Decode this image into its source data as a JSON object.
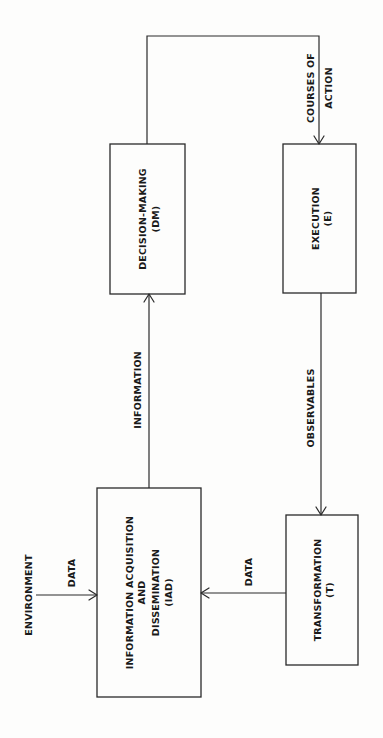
{
  "diagram": {
    "orientation": "rotated-90-ccw",
    "colors": {
      "stroke": "#2a2a2a",
      "text": "#1a1a1a",
      "background": "#fdfdfc"
    },
    "nodes": {
      "iad": {
        "line1": "INFORMATION  ACQUISITION",
        "line2": "AND",
        "line3": "DISSEMINATION",
        "line4": "(IAD)"
      },
      "dm": {
        "line1": "DECISION-MAKING",
        "line2": "(DM)"
      },
      "e": {
        "line1": "EXECUTION",
        "line2": "(E)"
      },
      "t": {
        "line1": "TRANSFORMATION",
        "line2": "(T)"
      }
    },
    "external": {
      "environment": "ENVIRONMENT"
    },
    "edges": {
      "env_to_iad": "DATA",
      "iad_to_dm": "INFORMATION",
      "dm_to_e_line1": "COURSES  OF",
      "dm_to_e_line2": "ACTION",
      "e_to_t": "OBSERVABLES",
      "t_to_iad": "DATA"
    }
  }
}
